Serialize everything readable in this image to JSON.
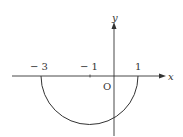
{
  "figure": {
    "axes": {
      "x_label": "x",
      "y_label": "y",
      "origin_label": "O"
    },
    "ticks": [
      {
        "value": -3,
        "label": "− 3"
      },
      {
        "value": -1,
        "label": "− 1"
      },
      {
        "value": 1,
        "label": "1"
      }
    ],
    "curve": {
      "type": "lower semicircle",
      "center": [
        -1,
        0
      ],
      "radius": 2,
      "from_x": -3,
      "to_x": 1
    },
    "colors": {
      "stroke": "#333333",
      "background": "#ffffff"
    }
  }
}
